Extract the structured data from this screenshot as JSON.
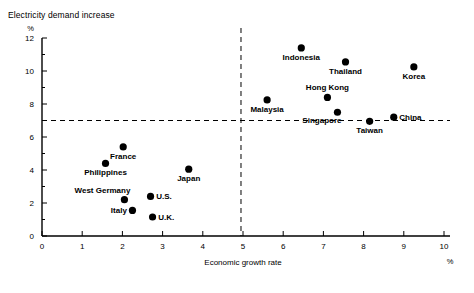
{
  "figure": {
    "title": "Electricity demand increase",
    "y_unit": "%",
    "x_unit": "%"
  },
  "chart_data": {
    "type": "scatter",
    "title": "Electricity demand increase",
    "xlabel": "Economic growth rate",
    "ylabel": "Electricity demand increase",
    "x_unit": "%",
    "y_unit": "%",
    "xlim": [
      0,
      10
    ],
    "ylim": [
      0,
      12
    ],
    "xticks": [
      0,
      1,
      2,
      3,
      4,
      5,
      6,
      7,
      8,
      9,
      10
    ],
    "xtick_labels": [
      "0",
      "1",
      "2",
      "3",
      "4",
      "5",
      "6",
      "7",
      "8",
      "9",
      "10"
    ],
    "yticks": [
      0,
      2,
      4,
      6,
      8,
      10,
      12
    ],
    "ytick_labels": [
      "0",
      "2",
      "4",
      "6",
      "8",
      "10",
      "12"
    ],
    "y_minor_ticks": [
      1,
      3,
      5,
      7,
      9,
      11
    ],
    "grid": false,
    "legend": "none",
    "reference_lines": [
      {
        "name": "horizontal-reference",
        "orientation": "horizontal",
        "value": 7.0,
        "style": "dashed"
      },
      {
        "name": "vertical-reference",
        "orientation": "vertical",
        "value": 4.95,
        "style": "dashed"
      }
    ],
    "points": [
      {
        "label": "Indonesia",
        "x": 6.45,
        "y": 11.4,
        "label_pos": "below"
      },
      {
        "label": "Thailand",
        "x": 7.55,
        "y": 10.55,
        "label_pos": "below"
      },
      {
        "label": "Korea",
        "x": 9.25,
        "y": 10.25,
        "label_pos": "below"
      },
      {
        "label": "Hong Kong",
        "x": 7.1,
        "y": 8.4,
        "label_pos": "above"
      },
      {
        "label": "Malaysia",
        "x": 5.6,
        "y": 8.25,
        "label_pos": "below"
      },
      {
        "label": "Singapore",
        "x": 7.35,
        "y": 7.5,
        "label_pos": "below-left"
      },
      {
        "label": "China",
        "x": 8.75,
        "y": 7.2,
        "label_pos": "right"
      },
      {
        "label": "Taiwan",
        "x": 8.15,
        "y": 6.95,
        "label_pos": "below"
      },
      {
        "label": "France",
        "x": 2.02,
        "y": 5.4,
        "label_pos": "below"
      },
      {
        "label": "Philippines",
        "x": 1.58,
        "y": 4.4,
        "label_pos": "below"
      },
      {
        "label": "Japan",
        "x": 3.65,
        "y": 4.05,
        "label_pos": "below"
      },
      {
        "label": "U.S.",
        "x": 2.7,
        "y": 2.4,
        "label_pos": "right"
      },
      {
        "label": "West Germany",
        "x": 2.05,
        "y": 2.2,
        "label_pos": "above-left"
      },
      {
        "label": "Italy",
        "x": 2.25,
        "y": 1.55,
        "label_pos": "left"
      },
      {
        "label": "U.K.",
        "x": 2.75,
        "y": 1.15,
        "label_pos": "right"
      }
    ]
  }
}
